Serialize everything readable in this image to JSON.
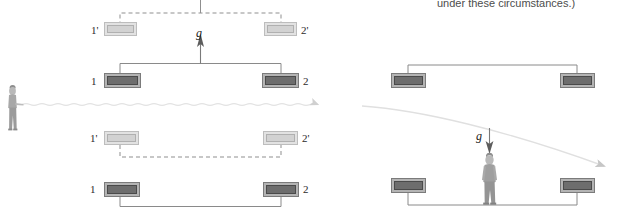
{
  "figure": {
    "name": "equivalence-principle-light-bending",
    "caption_fragment": "under these circumstances.)",
    "colors": {
      "box_solid_fill": "#6d6d6d",
      "box_solid_frame": "#b4b4b4",
      "box_ghost_fill": "#d2d2d2",
      "box_ghost_frame": "#e2e2e2",
      "bracket_solid": "#8a8a8a",
      "bracket_dashed": "#8f8f8f",
      "light_ray": "#e3e3e3",
      "arrow_g": "#777777",
      "label_text": "#2b2b2b",
      "caption_text": "#4d4d4d"
    }
  },
  "left_panel": {
    "name": "accelerating-frame-panel",
    "g_label": "g",
    "g_direction": "up",
    "rows": [
      {
        "row_name": "upper-primed-row",
        "style": "ghost",
        "bracket": "dashed-up",
        "left_label": "1'",
        "right_label": "2'"
      },
      {
        "row_name": "upper-unprimed-row",
        "style": "solid",
        "bracket": "solid-up",
        "left_label": "1",
        "right_label": "2"
      },
      {
        "row_name": "lower-primed-row",
        "style": "ghost",
        "bracket": "dashed-down",
        "left_label": "1'",
        "right_label": "2'"
      },
      {
        "row_name": "lower-unprimed-row",
        "style": "solid",
        "bracket": "solid-down",
        "left_label": "1",
        "right_label": "2"
      }
    ],
    "light_ray": {
      "name": "straight-light-ray",
      "shape": "straight-horizontal-wavy",
      "arrowhead": "right"
    },
    "observer": {
      "name": "standing-observer-figure",
      "position": "left-edge"
    }
  },
  "right_panel": {
    "name": "gravitational-frame-panel",
    "g_label": "g",
    "g_direction": "down",
    "rows": [
      {
        "row_name": "upper-row",
        "style": "solid",
        "bracket": "solid-up",
        "left_label": "",
        "right_label": ""
      },
      {
        "row_name": "lower-row",
        "style": "solid",
        "bracket": "solid-down",
        "left_label": "",
        "right_label": ""
      }
    ],
    "light_ray": {
      "name": "curved-light-ray",
      "shape": "downward-bending-curve",
      "arrowhead": "lower-right"
    },
    "observer": {
      "name": "standing-observer-figure",
      "position": "center"
    }
  }
}
